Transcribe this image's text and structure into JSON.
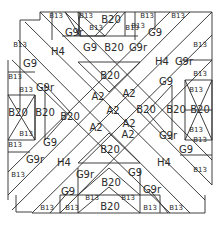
{
  "diagram": {
    "line_color": "#2a2a2a",
    "background": "#ffffff",
    "labels": {
      "top_b13_1": "B13",
      "top_b13_2": "B13",
      "top_b20": "B20",
      "top_b13_3": "B13",
      "top_b13_4": "B13",
      "top_b13_5": "B13",
      "top_b13_6": "B13",
      "top_b13_7": "B13",
      "top_g9r_1": "G9r",
      "top_g9_1": "G9",
      "top_b20_2": "B20",
      "top_g9r_2": "G9r",
      "top_g9_2": "G9",
      "h4_tl": "H4",
      "h4_tr": "H4",
      "h4_bl": "H4",
      "h4_br": "H4",
      "left_b13_1": "B13",
      "left_g9": "G9",
      "left_b13_2": "B13",
      "left_b13_3": "B13",
      "left_b20_1": "B20",
      "left_b20_2": "B20",
      "left_b13_4": "B13",
      "left_b13_5": "B13",
      "left_g9r": "G9r",
      "left_g9_2": "G9",
      "left_g9r_2": "G9r",
      "left_b13_6": "B13",
      "right_b13_1": "B13",
      "right_g9r": "G9r",
      "right_b13_2": "B13",
      "right_g9": "G9",
      "right_b13_3": "B13",
      "right_b20_1": "B20",
      "right_b20_2": "B20",
      "right_b13_4": "B13",
      "right_g9r_2": "G9r",
      "right_b13_5": "B13",
      "right_g9_2": "G9",
      "right_b13_6": "B13",
      "center_b20_top": "B20",
      "center_b20_left": "B20",
      "center_b20_right": "B20",
      "center_b20_bottom": "B20",
      "a2_1": "A2",
      "a2_2": "A2",
      "a2_3": "A2",
      "a2_4": "A2",
      "a2_5": "A2",
      "a2_6": "A2",
      "bot_g9r": "G9r",
      "bot_g9": "G9",
      "bot_b20": "B20",
      "bot_g9_2": "G9",
      "bot_g9r_2": "G9r",
      "bot_b13_1": "B13",
      "bot_b13_2": "B13",
      "bot_b13_3": "B13",
      "bot_b13_4": "B13",
      "bot_b20_2": "B20",
      "bot_b13_5": "B13",
      "bot_b13_6": "B13"
    }
  }
}
